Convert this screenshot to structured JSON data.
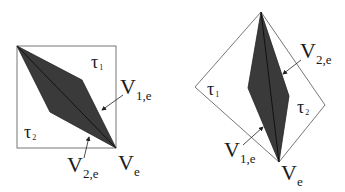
{
  "figures": [
    {
      "id": "left",
      "frame": "square",
      "regions": [
        {
          "symbol": "τ",
          "sub": "1"
        },
        {
          "symbol": "τ",
          "sub": "2"
        }
      ],
      "labels": [
        {
          "main": "V",
          "sub": "1,e"
        },
        {
          "main": "V",
          "sub": "2,e"
        },
        {
          "main": "V",
          "sub": "e"
        }
      ]
    },
    {
      "id": "right",
      "frame": "diamond",
      "regions": [
        {
          "symbol": "τ",
          "sub": "1"
        },
        {
          "symbol": "τ",
          "sub": "2"
        }
      ],
      "labels": [
        {
          "main": "V",
          "sub": "2,e"
        },
        {
          "main": "V",
          "sub": "1,e"
        },
        {
          "main": "V",
          "sub": "e"
        }
      ]
    }
  ],
  "colors": {
    "frame": "#777777",
    "fill": "#3a3a3a",
    "edge": "#111111",
    "text": "#1a1a1a"
  }
}
